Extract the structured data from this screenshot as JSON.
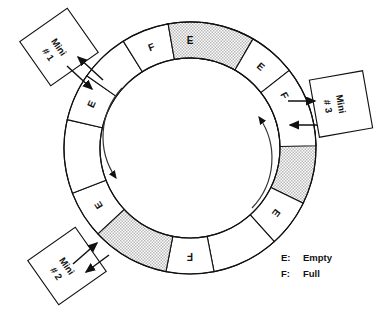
{
  "diagram": {
    "ring": {
      "center_x": 190,
      "center_y": 148,
      "outer_radius": 126,
      "inner_radius": 90,
      "rotation_direction": "clockwise",
      "stipple_color": "#cccccc",
      "outline_color": "#111111",
      "background_color": "#ffffff"
    },
    "segments": [
      {
        "id": "seg-1",
        "label": "E",
        "state": "empty",
        "shaded": false,
        "start_angle": -101,
        "end_angle": -79,
        "labeled": true
      },
      {
        "id": "seg-2",
        "label": "",
        "state": "empty",
        "shaded": false,
        "start_angle": -79,
        "end_angle": -40,
        "labeled": false
      },
      {
        "id": "seg-3",
        "label": "F",
        "state": "full",
        "shaded": false,
        "start_angle": -40,
        "end_angle": -18,
        "labeled": true
      },
      {
        "id": "seg-4",
        "label": "",
        "state": "full",
        "shaded": true,
        "start_angle": -18,
        "end_angle": 26,
        "labeled": false
      },
      {
        "id": "seg-5",
        "label": "E",
        "state": "empty",
        "shaded": false,
        "start_angle": 26,
        "end_angle": 48,
        "labeled": true
      },
      {
        "id": "seg-6",
        "label": "",
        "state": "empty",
        "shaded": false,
        "start_angle": 48,
        "end_angle": 79,
        "labeled": false
      },
      {
        "id": "seg-7",
        "label": "F",
        "state": "full",
        "shaded": false,
        "start_angle": 79,
        "end_angle": 101,
        "labeled": true
      },
      {
        "id": "seg-8",
        "label": "",
        "state": "full",
        "shaded": true,
        "start_angle": 101,
        "end_angle": 137,
        "labeled": false
      },
      {
        "id": "seg-9",
        "label": "E",
        "state": "empty",
        "shaded": false,
        "start_angle": 137,
        "end_angle": 159,
        "labeled": true
      },
      {
        "id": "seg-10",
        "label": "",
        "state": "empty",
        "shaded": false,
        "start_angle": 159,
        "end_angle": 193,
        "labeled": false
      },
      {
        "id": "seg-11",
        "label": "E",
        "state": "empty",
        "shaded": false,
        "start_angle": 193,
        "end_angle": 215,
        "labeled": true
      },
      {
        "id": "seg-12",
        "label": "",
        "state": "empty",
        "shaded": false,
        "start_angle": 215,
        "end_angle": 238,
        "labeled": false
      },
      {
        "id": "seg-13",
        "label": "F",
        "state": "full",
        "shaded": false,
        "start_angle": 238,
        "end_angle": 260,
        "labeled": true
      },
      {
        "id": "seg-14",
        "label": "",
        "state": "full",
        "shaded": true,
        "start_angle": 260,
        "end_angle": 300,
        "labeled": false
      },
      {
        "id": "seg-15",
        "label": "E",
        "state": "empty",
        "shaded": false,
        "start_angle": 300,
        "end_angle": 322,
        "labeled": true
      },
      {
        "id": "seg-16",
        "label": "",
        "state": "empty",
        "shaded": false,
        "start_angle": 322,
        "end_angle": 359,
        "labeled": false
      }
    ],
    "stations": [
      {
        "id": "mini-1",
        "line1": "Mini",
        "line2": "# 1",
        "cx": 59,
        "cy": 47,
        "w": 58,
        "h": 54,
        "rotation": -35,
        "attach_x": 92,
        "attach_y": 90
      },
      {
        "id": "mini-2",
        "line1": "Mini",
        "line2": "# 2",
        "cx": 67,
        "cy": 266,
        "w": 58,
        "h": 54,
        "rotation": -35,
        "attach_x": 104,
        "attach_y": 236
      },
      {
        "id": "mini-3",
        "line1": "Mini",
        "line2": "# 3",
        "cx": 341,
        "cy": 104,
        "w": 54,
        "h": 58,
        "rotation": -10,
        "attach_x": 303,
        "attach_y": 113
      }
    ],
    "rotation_arrows": [
      {
        "id": "rot-arrow-left",
        "direction": "down",
        "note": "clockwise flow indicator on left of inner disc"
      },
      {
        "id": "rot-arrow-right",
        "direction": "up",
        "note": "clockwise flow indicator on right of inner disc"
      }
    ],
    "legend": {
      "rows": [
        {
          "key": "E:",
          "value": "Empty"
        },
        {
          "key": "F:",
          "value": "Full"
        }
      ]
    }
  }
}
